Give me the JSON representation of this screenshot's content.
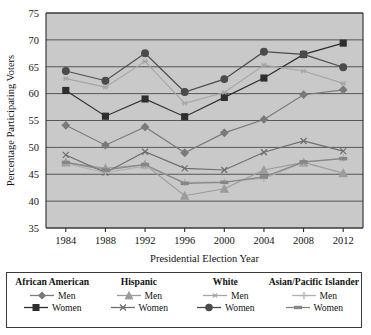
{
  "chart_data": {
    "type": "line",
    "title": "",
    "xlabel": "Presidential Election Year",
    "ylabel": "Percentage Participating Voters",
    "categories": [
      "1984",
      "1988",
      "1992",
      "1996",
      "2000",
      "2004",
      "2008",
      "2012"
    ],
    "ylim": [
      35,
      75
    ],
    "yticks": [
      35,
      40,
      45,
      50,
      55,
      60,
      65,
      70,
      75
    ],
    "grid": true,
    "legend_position": "bottom",
    "series": [
      {
        "name": "African American Men",
        "group": "African American",
        "sex": "Men",
        "marker": "diamond",
        "color": "#7a7a7a",
        "values": [
          54.1,
          50.4,
          53.8,
          49.0,
          52.7,
          55.2,
          59.8,
          60.7
        ]
      },
      {
        "name": "African American Women",
        "group": "African American",
        "sex": "Women",
        "marker": "square",
        "color": "#2e2e2e",
        "values": [
          60.6,
          55.8,
          59.0,
          55.7,
          59.3,
          62.9,
          67.3,
          69.4
        ]
      },
      {
        "name": "Hispanic Men",
        "group": "Hispanic",
        "sex": "Men",
        "marker": "triangle",
        "color": "#9c9c9c",
        "values": [
          47.2,
          46.1,
          46.8,
          41.0,
          42.3,
          45.8,
          47.2,
          45.2
        ]
      },
      {
        "name": "Hispanic Women",
        "group": "Hispanic",
        "sex": "Women",
        "marker": "x",
        "color": "#6e6e6e",
        "values": [
          48.6,
          45.3,
          49.2,
          46.1,
          45.8,
          49.1,
          51.2,
          49.3
        ]
      },
      {
        "name": "White Men",
        "group": "White",
        "sex": "Men",
        "marker": "asterisk",
        "color": "#a6a6a6",
        "values": [
          62.8,
          61.2,
          66.0,
          58.2,
          60.2,
          65.3,
          64.2,
          61.9
        ]
      },
      {
        "name": "White Women",
        "group": "White",
        "sex": "Women",
        "marker": "circle",
        "color": "#4b4b4b",
        "values": [
          64.2,
          62.4,
          67.5,
          60.3,
          62.7,
          67.8,
          67.3,
          64.9
        ]
      },
      {
        "name": "Asian/Pacific Islander Men",
        "group": "Asian/Pacific Islander",
        "sex": "Men",
        "marker": "plus",
        "color": "#b0b0b0",
        "values": [
          47.0,
          45.3,
          46.5,
          43.5,
          43.6,
          44.2,
          47.2,
          48.0
        ]
      },
      {
        "name": "Asian/Pacific Islander Women",
        "group": "Asian/Pacific Islander",
        "sex": "Women",
        "marker": "dash",
        "color": "#868686",
        "values": [
          47.2,
          45.8,
          46.8,
          43.3,
          43.5,
          44.5,
          47.3,
          47.9
        ]
      }
    ]
  },
  "legend": {
    "groups": [
      {
        "title": "African American",
        "rows": [
          {
            "label": "Men",
            "series_index": 0
          },
          {
            "label": "Women",
            "series_index": 1
          }
        ]
      },
      {
        "title": "Hispanic",
        "rows": [
          {
            "label": "Men",
            "series_index": 2
          },
          {
            "label": "Women",
            "series_index": 3
          }
        ]
      },
      {
        "title": "White",
        "rows": [
          {
            "label": "Men",
            "series_index": 4
          },
          {
            "label": "Women",
            "series_index": 5
          }
        ]
      },
      {
        "title": "Asian/Pacific Islander",
        "rows": [
          {
            "label": "Men",
            "series_index": 6
          },
          {
            "label": "Women",
            "series_index": 7
          }
        ]
      }
    ]
  },
  "style": {
    "plot_background": "#c9c9c9",
    "axis_color": "#2b2b2b",
    "gridline_color": "#4a4a4a",
    "page_background": "#ffffff"
  }
}
